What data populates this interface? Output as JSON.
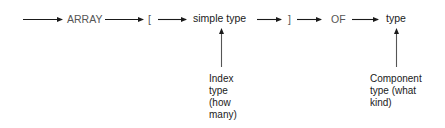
{
  "diagram": {
    "type": "syntax-diagram",
    "title": "",
    "main_path": [
      {
        "id": "array_kw",
        "text": "ARRAY"
      },
      {
        "id": "open_bracket",
        "text": "["
      },
      {
        "id": "simple_type",
        "text": "simple type"
      },
      {
        "id": "close_bracket",
        "text": "]"
      },
      {
        "id": "of_kw",
        "text": "OF"
      },
      {
        "id": "type",
        "text": "type"
      }
    ],
    "annotations": {
      "index": {
        "points_to": "simple type",
        "lines": [
          "Index",
          "type",
          "(how",
          "many)"
        ]
      },
      "component": {
        "points_to": "type",
        "lines": [
          "Component",
          "type (what",
          "kind)"
        ]
      }
    },
    "edges": [
      {
        "from": "start",
        "to": "ARRAY"
      },
      {
        "from": "ARRAY",
        "to": "["
      },
      {
        "from": "[",
        "to": "simple type"
      },
      {
        "from": "simple type",
        "to": "]"
      },
      {
        "from": "]",
        "to": "OF"
      },
      {
        "from": "OF",
        "to": "type"
      }
    ],
    "colors": {
      "arrow": "#1a1a1a",
      "pointer": "#555555",
      "text": "#1a1a1a"
    }
  }
}
